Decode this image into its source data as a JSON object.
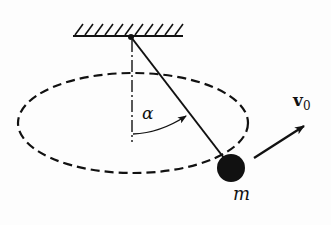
{
  "diagram": {
    "labels": {
      "angle": "α",
      "velocity_symbol": "v",
      "velocity_subscript": "0",
      "mass": "m"
    },
    "colors": {
      "ink": "#111111",
      "background": "#fdfdfd"
    },
    "elements": {
      "ceiling": {
        "x1": 73,
        "x2": 183,
        "y": 36,
        "hatch_count": 11
      },
      "pivot": {
        "x": 131,
        "y": 37
      },
      "vertical_axis": {
        "x": 131,
        "y1": 37,
        "y2": 142,
        "style": "dash-dot"
      },
      "string": {
        "x1": 131,
        "y1": 37,
        "x2": 228,
        "y2": 160
      },
      "bob": {
        "cx": 231,
        "cy": 168,
        "r": 14
      },
      "orbit": {
        "cx": 133,
        "cy": 123,
        "rx": 115,
        "ry": 50,
        "style": "dashed"
      },
      "velocity_arrow": {
        "x1": 254,
        "y1": 158,
        "x2": 304,
        "y2": 126
      }
    }
  }
}
